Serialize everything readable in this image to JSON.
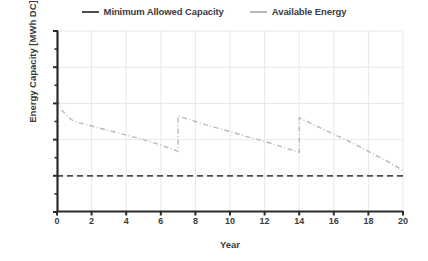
{
  "chart_data": {
    "type": "line",
    "title": "",
    "xlabel": "Year",
    "ylabel": "Energy Capacity [MWh DC]",
    "xlim": [
      0,
      20
    ],
    "ylim": [
      18,
      28
    ],
    "xticks": [
      0,
      2,
      4,
      6,
      8,
      10,
      12,
      14,
      16,
      18,
      20
    ],
    "yticks": [
      18,
      20,
      22,
      24,
      26,
      28
    ],
    "yticks_minor": [
      19,
      21,
      23,
      25,
      27
    ],
    "grid": true,
    "legend_position": "top-center",
    "series": [
      {
        "name": "Minimum Allowed Capacity",
        "style": "dashed",
        "color": "#4d4d4d",
        "x": [
          0,
          20
        ],
        "values": [
          20,
          20
        ]
      },
      {
        "name": "Available Energy",
        "style": "dash-dot",
        "color": "#b8b8b8",
        "x": [
          0,
          0.3,
          0.7,
          1,
          2,
          3,
          4,
          5,
          6,
          7,
          7,
          8,
          9,
          10,
          11,
          12,
          13,
          14,
          14,
          15,
          16,
          17,
          18,
          19,
          20
        ],
        "values": [
          24.2,
          23.6,
          23.2,
          23.0,
          22.75,
          22.5,
          22.25,
          22.0,
          21.7,
          21.35,
          23.3,
          23.0,
          22.7,
          22.45,
          22.15,
          21.9,
          21.6,
          21.3,
          23.2,
          22.75,
          22.3,
          21.85,
          21.35,
          20.85,
          20.3
        ]
      }
    ],
    "annotations": []
  },
  "legend": {
    "entries": [
      {
        "label": "Minimum Allowed Capacity"
      },
      {
        "label": "Available Energy"
      }
    ]
  },
  "axes": {
    "y_title": "Energy Capacity [MWh DC]",
    "x_title": "Year",
    "y_tick_labels": [
      "28",
      "26",
      "24",
      "22",
      "20",
      "18"
    ],
    "x_tick_labels": [
      "0",
      "2",
      "4",
      "6",
      "8",
      "10",
      "12",
      "14",
      "16",
      "18",
      "20"
    ]
  },
  "colors": {
    "minimum_allowed_capacity": "#4d4d4d",
    "available_energy": "#b8b8b8",
    "grid": "#e8e8e8",
    "axis": "#2b2b2b",
    "text": "#3c3c3c",
    "background": "#ffffff"
  }
}
